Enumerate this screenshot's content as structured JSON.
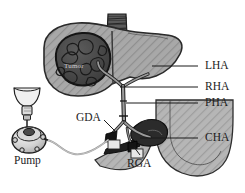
{
  "figure": {
    "background_color": "#ffffff",
    "line_color": "#1b1b1b"
  },
  "labels": {
    "lha": "LHA",
    "rha": "RHA",
    "pha": "PHA",
    "cha": "CHA",
    "gda": "GDA",
    "rga": "RGA",
    "pump": "Pump",
    "tumor": "Tumor"
  },
  "label_positions": {
    "lha": {
      "x": 205,
      "y": 62
    },
    "rha": {
      "x": 205,
      "y": 83
    },
    "pha": {
      "x": 205,
      "y": 99
    },
    "cha": {
      "x": 205,
      "y": 134
    },
    "gda": {
      "x": 78,
      "y": 112
    },
    "rga": {
      "x": 128,
      "y": 158
    },
    "pump": {
      "x": 16,
      "y": 153
    },
    "tumor": {
      "x": 64,
      "y": 64
    }
  },
  "anatomy": {
    "liver": {
      "name": "liver",
      "fill": "#a9a9a9",
      "stroke": "#2a2a2a",
      "hatched": true
    },
    "tumor": {
      "name": "hepatic-tumor",
      "fill": "#4a4a4a",
      "stroke": "#1a1a1a"
    },
    "stomach": {
      "name": "stomach",
      "fill": "#b5b5b5",
      "stroke": "#2a2a2a",
      "hatched": true
    },
    "vena_cava": {
      "name": "vena-cava",
      "fill": "#585858",
      "stroke": "#1a1a1a"
    },
    "arteries": {
      "name": "hepatic-arterial-tree",
      "fill": "#8e8e8e",
      "stroke": "#1f1f1f"
    },
    "pancreas": {
      "name": "pancreas-mass",
      "fill": "#2e2e2e",
      "stroke": "#101010"
    }
  },
  "device": {
    "pump": {
      "name": "infusion-pump",
      "fill": "#cfcfcf",
      "stroke": "#1f1f1f"
    },
    "syringe": {
      "name": "syringe",
      "fill": "#e6e6e6",
      "stroke": "#1f1f1f"
    },
    "funnel": {
      "name": "funnel-reservoir",
      "fill": "#efefef",
      "stroke": "#1f1f1f"
    },
    "catheter": {
      "name": "catheter-tubing",
      "stroke": "#9a9a9a"
    }
  },
  "leader_lines": {
    "lha": {
      "x1": 198,
      "y1": 66,
      "x2": 152,
      "y2": 66
    },
    "rha": {
      "x1": 198,
      "y1": 87,
      "x2": 120,
      "y2": 87
    },
    "pha": {
      "x1": 198,
      "y1": 103,
      "x2": 126,
      "y2": 103
    },
    "cha": {
      "x1": 198,
      "y1": 138,
      "x2": 140,
      "y2": 138
    },
    "gda": {
      "x1": 104,
      "y1": 120,
      "x2": 118,
      "y2": 134
    },
    "rga": {
      "x1": 140,
      "y1": 155,
      "x2": 133,
      "y2": 146
    }
  }
}
